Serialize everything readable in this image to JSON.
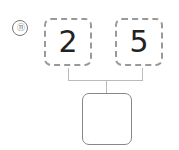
{
  "problem_number": "⑪",
  "inputs": [
    {
      "value": "2"
    },
    {
      "value": "5"
    }
  ],
  "result": {
    "value": ""
  }
}
